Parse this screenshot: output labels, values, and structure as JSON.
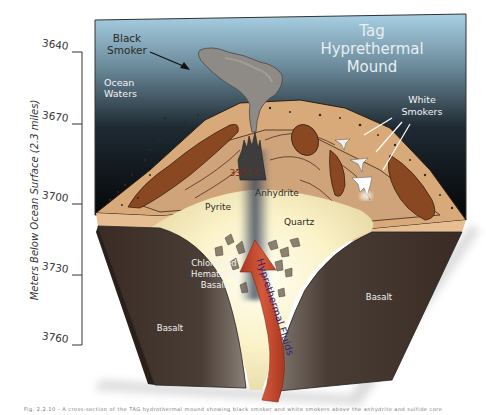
{
  "figure": {
    "title_lines": [
      "Tag",
      "Hyprethermal",
      "Mound"
    ],
    "caption": "Fig. 2.2.10 - A cross-section of the TAG hydrothermal mound showing black smoker and white smokers above the anhydrite and sulfide core"
  },
  "axis": {
    "title": "Meters Below Ocean Surface (2.3 miles)",
    "ticks": [
      {
        "value": "3640",
        "y": 52
      },
      {
        "value": "3670",
        "y": 124
      },
      {
        "value": "3700",
        "y": 204
      },
      {
        "value": "3730",
        "y": 275
      },
      {
        "value": "3760",
        "y": 345
      }
    ]
  },
  "labels": {
    "black_smoker": [
      "Black",
      "Smoker"
    ],
    "ocean_waters": [
      "Ocean",
      "Waters"
    ],
    "white_smokers": [
      "White",
      "Smokers"
    ],
    "temperature": "335° C",
    "anhydrite": "Anhydrite",
    "pyrite": "Pyrite",
    "quartz": "Quartz",
    "chloritized": [
      "Chloritized",
      "Hematized",
      "Basalt"
    ],
    "basalt_left": "Basalt",
    "basalt_right": "Basalt",
    "fluids": "Hyprethermal Fluids"
  },
  "colors": {
    "sky_top": "#9cc6dc",
    "sky_bottom": "#050608",
    "sediment": "#d9ab7a",
    "sediment_dark": "#c99a6c",
    "lens": "#8b4a22",
    "core_glow": "#fff8dc",
    "basalt": "#3d2f28",
    "basalt_grey": "#6e645c",
    "fluid_arrow": "#c0472d",
    "fluid_text": "#3a2a6a"
  }
}
